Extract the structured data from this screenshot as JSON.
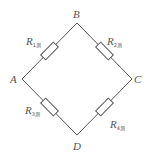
{
  "diagram": {
    "type": "wheatstone-bridge",
    "nodes": [
      {
        "id": "A",
        "label": "A",
        "x": 22,
        "y": 79
      },
      {
        "id": "B",
        "label": "B",
        "x": 77,
        "y": 23
      },
      {
        "id": "C",
        "label": "C",
        "x": 132,
        "y": 79
      },
      {
        "id": "D",
        "label": "D",
        "x": 77,
        "y": 135
      }
    ],
    "resistors": [
      {
        "id": "R1",
        "label": "R",
        "subscript": "1测",
        "from": "A",
        "to": "B"
      },
      {
        "id": "R2",
        "label": "R",
        "subscript": "2测",
        "from": "B",
        "to": "C"
      },
      {
        "id": "R3",
        "label": "R",
        "subscript": "3测",
        "from": "A",
        "to": "D"
      },
      {
        "id": "R4",
        "label": "R",
        "subscript": "4测",
        "from": "D",
        "to": "C"
      }
    ],
    "colors": {
      "line": "#555555",
      "background": "#ffffff"
    }
  }
}
